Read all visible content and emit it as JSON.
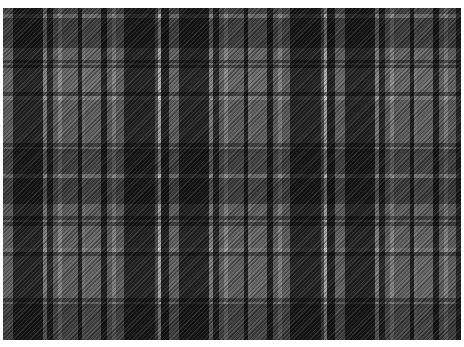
{
  "image": {
    "description": "Grayscale tartan plaid fabric pattern",
    "palette": {
      "dark": "#1e1e1e",
      "medium": "#707070",
      "light": "#9a9a9a",
      "highlight": "#e0e0e0",
      "background": "#ffffff"
    },
    "sett": {
      "horizontal_repeat_px": 166,
      "vertical_extent_px": 332
    }
  }
}
